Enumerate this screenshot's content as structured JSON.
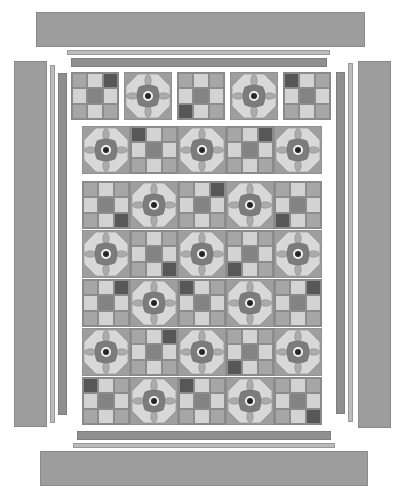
{
  "palette": {
    "L": "#d3d3d3",
    "M": "#a6a6a6",
    "K": "#838383",
    "D": "#575757",
    "flower_square": "#9e9e9e",
    "flower_octagon": "#d8d8d8",
    "flower_body": "#7c7c7c",
    "flower_petal": "#ababab",
    "flower_ring": "#f2f2f2",
    "flower_center": "#262626",
    "border_wide": "#9d9d9d",
    "strip_thin": "#bcbcbc",
    "strip_med": "#8f8f8f"
  },
  "borders": {
    "top_wide": {
      "x": 36,
      "y": 12,
      "w": 329,
      "h": 35
    },
    "top_thin": {
      "x": 67,
      "y": 50,
      "w": 263,
      "h": 5
    },
    "top_med": {
      "x": 71,
      "y": 58,
      "w": 256,
      "h": 9
    },
    "bottom_med": {
      "x": 77,
      "y": 431,
      "w": 254,
      "h": 9
    },
    "bottom_thin": {
      "x": 73,
      "y": 443,
      "w": 262,
      "h": 5
    },
    "bottom_wide": {
      "x": 40,
      "y": 451,
      "w": 328,
      "h": 35
    },
    "left_wide": {
      "x": 14,
      "y": 61,
      "w": 33,
      "h": 366
    },
    "left_thin": {
      "x": 50,
      "y": 65,
      "w": 5,
      "h": 358
    },
    "left_med": {
      "x": 58,
      "y": 73,
      "w": 9,
      "h": 342
    },
    "right_med": {
      "x": 336,
      "y": 72,
      "w": 9,
      "h": 342
    },
    "right_thin": {
      "x": 348,
      "y": 63,
      "w": 5,
      "h": 359
    },
    "right_wide": {
      "x": 358,
      "y": 61,
      "w": 33,
      "h": 367
    }
  },
  "rows": [
    {
      "name": "top-separate-row",
      "x": 71,
      "y": 72,
      "gap": 5,
      "blocks": [
        {
          "type": "ninepatch",
          "cells": [
            "M",
            "L",
            "D",
            "L",
            "K",
            "L",
            "M",
            "L",
            "M"
          ]
        },
        {
          "type": "flower"
        },
        {
          "type": "ninepatch",
          "cells": [
            "M",
            "L",
            "M",
            "L",
            "K",
            "L",
            "D",
            "L",
            "M"
          ]
        },
        {
          "type": "flower"
        },
        {
          "type": "ninepatch",
          "cells": [
            "D",
            "L",
            "M",
            "L",
            "K",
            "L",
            "M",
            "L",
            "M"
          ]
        }
      ]
    },
    {
      "name": "second-row",
      "x": 82,
      "y": 126,
      "gap": 0,
      "blocks": [
        {
          "type": "flower"
        },
        {
          "type": "ninepatch",
          "cells": [
            "D",
            "L",
            "M",
            "L",
            "K",
            "L",
            "M",
            "L",
            "M"
          ]
        },
        {
          "type": "flower"
        },
        {
          "type": "ninepatch",
          "cells": [
            "M",
            "L",
            "D",
            "L",
            "K",
            "L",
            "M",
            "L",
            "M"
          ]
        },
        {
          "type": "flower"
        }
      ]
    },
    {
      "name": "main-row-1",
      "x": 82,
      "y": 181,
      "gap": 0,
      "blocks": [
        {
          "type": "ninepatch",
          "cells": [
            "M",
            "L",
            "M",
            "L",
            "K",
            "L",
            "M",
            "L",
            "D"
          ]
        },
        {
          "type": "flower"
        },
        {
          "type": "ninepatch",
          "cells": [
            "M",
            "L",
            "D",
            "L",
            "K",
            "L",
            "M",
            "L",
            "M"
          ]
        },
        {
          "type": "flower"
        },
        {
          "type": "ninepatch",
          "cells": [
            "M",
            "L",
            "M",
            "L",
            "K",
            "L",
            "D",
            "L",
            "M"
          ]
        }
      ]
    },
    {
      "name": "main-row-2",
      "x": 82,
      "y": 230,
      "gap": 0,
      "blocks": [
        {
          "type": "flower"
        },
        {
          "type": "ninepatch",
          "cells": [
            "M",
            "L",
            "M",
            "L",
            "K",
            "L",
            "M",
            "L",
            "D"
          ]
        },
        {
          "type": "flower"
        },
        {
          "type": "ninepatch",
          "cells": [
            "M",
            "L",
            "M",
            "L",
            "K",
            "L",
            "D",
            "L",
            "M"
          ]
        },
        {
          "type": "flower"
        }
      ]
    },
    {
      "name": "main-row-3",
      "x": 82,
      "y": 279,
      "gap": 0,
      "blocks": [
        {
          "type": "ninepatch",
          "cells": [
            "M",
            "L",
            "D",
            "L",
            "K",
            "L",
            "M",
            "L",
            "M"
          ]
        },
        {
          "type": "flower"
        },
        {
          "type": "ninepatch",
          "cells": [
            "D",
            "L",
            "M",
            "L",
            "K",
            "L",
            "M",
            "L",
            "M"
          ]
        },
        {
          "type": "flower"
        },
        {
          "type": "ninepatch",
          "cells": [
            "M",
            "L",
            "D",
            "L",
            "K",
            "L",
            "M",
            "L",
            "M"
          ]
        }
      ]
    },
    {
      "name": "main-row-4",
      "x": 82,
      "y": 328,
      "gap": 0,
      "blocks": [
        {
          "type": "flower"
        },
        {
          "type": "ninepatch",
          "cells": [
            "M",
            "L",
            "D",
            "L",
            "K",
            "L",
            "M",
            "L",
            "M"
          ]
        },
        {
          "type": "flower"
        },
        {
          "type": "ninepatch",
          "cells": [
            "M",
            "L",
            "M",
            "L",
            "K",
            "L",
            "D",
            "L",
            "M"
          ]
        },
        {
          "type": "flower"
        }
      ]
    },
    {
      "name": "main-row-5",
      "x": 82,
      "y": 377,
      "gap": 0,
      "blocks": [
        {
          "type": "ninepatch",
          "cells": [
            "D",
            "L",
            "M",
            "L",
            "K",
            "L",
            "M",
            "L",
            "M"
          ]
        },
        {
          "type": "flower"
        },
        {
          "type": "ninepatch",
          "cells": [
            "D",
            "L",
            "M",
            "L",
            "K",
            "L",
            "M",
            "L",
            "M"
          ]
        },
        {
          "type": "flower"
        },
        {
          "type": "ninepatch",
          "cells": [
            "M",
            "L",
            "M",
            "L",
            "K",
            "L",
            "M",
            "L",
            "D"
          ]
        }
      ]
    }
  ]
}
